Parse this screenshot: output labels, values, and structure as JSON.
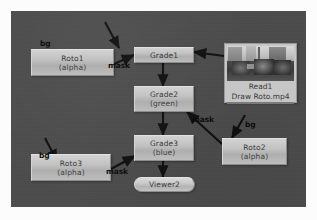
{
  "canvas": {
    "background_color": "#4c4c4c",
    "page_background": "#fcfcfc"
  },
  "nodes": [
    {
      "id": "roto1",
      "name": "Roto1",
      "sublabel": "(alpha)",
      "type": "roto"
    },
    {
      "id": "grade1",
      "name": "Grade1",
      "sublabel": "",
      "type": "grade"
    },
    {
      "id": "read1",
      "name": "Read1",
      "sublabel": "Draw Roto.mp4",
      "type": "read"
    },
    {
      "id": "grade2",
      "name": "Grade2",
      "sublabel": "(green)",
      "type": "grade"
    },
    {
      "id": "grade3",
      "name": "Grade3",
      "sublabel": "(blue)",
      "type": "grade"
    },
    {
      "id": "roto2",
      "name": "Roto2",
      "sublabel": "(alpha)",
      "type": "roto"
    },
    {
      "id": "roto3",
      "name": "Roto3",
      "sublabel": "(alpha)",
      "type": "roto"
    },
    {
      "id": "viewer2",
      "name": "Viewer2",
      "sublabel": "",
      "type": "viewer"
    }
  ],
  "wire_labels": {
    "bg_roto1": "bg",
    "mask_roto1": "mask",
    "mask_roto2": "mask",
    "bg_roto2": "bg",
    "bg_roto3": "bg",
    "mask_roto3": "mask"
  }
}
